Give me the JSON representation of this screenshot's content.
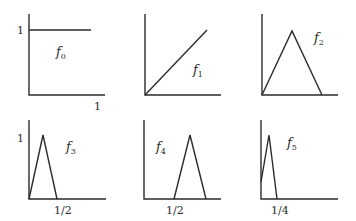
{
  "figure": {
    "panels": [
      {
        "name": "f0",
        "label_main": "f",
        "label_sub": "0",
        "y_tick_label": "1",
        "x_tick_label": "1",
        "shape": "constant",
        "points": [
          [
            0,
            1
          ],
          [
            1,
            1
          ]
        ]
      },
      {
        "name": "f1",
        "label_main": "f",
        "label_sub": "1",
        "y_tick_label": "",
        "x_tick_label": "",
        "shape": "linear",
        "points": [
          [
            0,
            0
          ],
          [
            1,
            1
          ]
        ]
      },
      {
        "name": "f2",
        "label_main": "f",
        "label_sub": "2",
        "y_tick_label": "",
        "x_tick_label": "",
        "shape": "triangle",
        "points": [
          [
            0,
            0
          ],
          [
            0.5,
            1
          ],
          [
            1,
            0
          ]
        ]
      },
      {
        "name": "f3",
        "label_main": "f",
        "label_sub": "3",
        "y_tick_label": "1",
        "x_tick_label": "1/2",
        "shape": "triangle",
        "points": [
          [
            0,
            0
          ],
          [
            0.25,
            1
          ],
          [
            0.5,
            0
          ]
        ]
      },
      {
        "name": "f4",
        "label_main": "f",
        "label_sub": "4",
        "y_tick_label": "",
        "x_tick_label": "1/2",
        "shape": "triangle",
        "points": [
          [
            0.5,
            0
          ],
          [
            0.75,
            1
          ],
          [
            1,
            0
          ]
        ]
      },
      {
        "name": "f5",
        "label_main": "f",
        "label_sub": "5",
        "y_tick_label": "",
        "x_tick_label": "1/4",
        "shape": "triangle",
        "points": [
          [
            0,
            0.3
          ],
          [
            0.125,
            1
          ],
          [
            0.25,
            0
          ]
        ]
      }
    ]
  }
}
